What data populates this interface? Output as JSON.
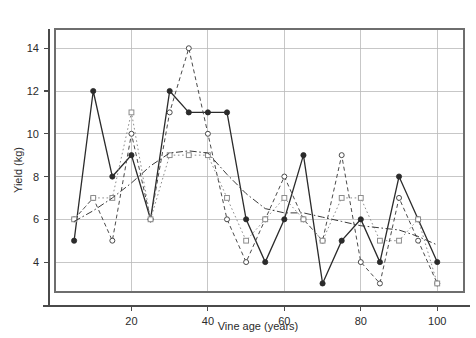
{
  "chart_data": {
    "type": "line",
    "title": "",
    "subtitle": "",
    "xlabel": "Vine age (years)",
    "ylabel": "Yield (kg)",
    "xlim": [
      0,
      107
    ],
    "ylim": [
      2.6,
      14.9
    ],
    "xticks": [
      20,
      40,
      60,
      80,
      100
    ],
    "xtick_labels": [
      "20",
      "40",
      "60",
      "80",
      "100"
    ],
    "yticks": [
      4,
      6,
      8,
      10,
      12,
      14
    ],
    "ytick_labels": [
      "4",
      "6",
      "8",
      "10",
      "12",
      "14"
    ],
    "grid": true,
    "grid_axis": "both",
    "legend": false,
    "legend_position": "none",
    "x": [
      5,
      10,
      15,
      20,
      25,
      30,
      35,
      40,
      45,
      50,
      55,
      60,
      65,
      70,
      75,
      80,
      85,
      90,
      95,
      100
    ],
    "series": [
      {
        "name": "series-1",
        "marker": "filled-circle",
        "linestyle": "solid",
        "color": "#2b2b2b",
        "values": [
          5,
          12,
          8,
          9,
          6,
          12,
          11,
          11,
          11,
          6,
          4,
          6,
          9,
          3,
          5,
          6,
          4,
          8,
          6,
          4
        ]
      },
      {
        "name": "series-2",
        "marker": "open-circle",
        "linestyle": "dashed",
        "color": "#4a4a4a",
        "values": [
          6,
          7,
          5,
          10,
          6,
          11,
          14,
          10,
          6,
          4,
          6,
          8,
          6,
          5,
          9,
          4,
          3,
          7,
          5,
          3
        ]
      },
      {
        "name": "series-3",
        "marker": "open-square",
        "linestyle": "dotted",
        "color": "#8c8c8c",
        "values": [
          6,
          7,
          7,
          11,
          6,
          9,
          9,
          9,
          7,
          5,
          6,
          7,
          6,
          5,
          7,
          7,
          5,
          5,
          6,
          3
        ]
      },
      {
        "name": "series-4-trend",
        "marker": "none",
        "linestyle": "dashdot",
        "color": "#3a3a3a",
        "values": [
          5.9,
          6.4,
          7.0,
          7.7,
          8.5,
          9.1,
          9.2,
          9.1,
          8.1,
          7.2,
          6.5,
          6.3,
          6.3,
          6.1,
          5.9,
          5.7,
          5.6,
          5.5,
          5.2,
          4.8
        ]
      }
    ]
  },
  "axes": {
    "y_axis_label": "Yield (kg)",
    "x_axis_label": "Vine age (years)"
  }
}
